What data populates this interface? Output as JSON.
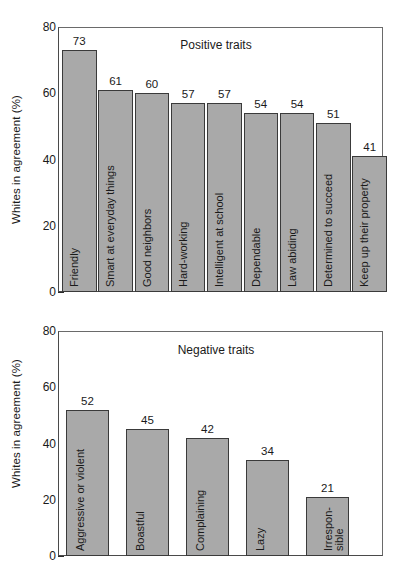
{
  "chart_data": [
    {
      "type": "bar",
      "title": "Positive traits",
      "xlabel": "",
      "ylabel": "Whites in agreement (%)",
      "ylim": [
        0,
        80
      ],
      "yticks": [
        0,
        20,
        40,
        60,
        80
      ],
      "yminorticks": [
        10,
        30,
        50,
        70
      ],
      "grid": false,
      "legend": "none",
      "categories": [
        "Friendly",
        "Smart at everyday things",
        "Good neighbors",
        "Hard-working",
        "Intelligent at school",
        "Dependable",
        "Law abiding",
        "Determined to succeed",
        "Keep up their property"
      ],
      "values": [
        73,
        61,
        60,
        57,
        57,
        54,
        54,
        51,
        41
      ]
    },
    {
      "type": "bar",
      "title": "Negative traits",
      "xlabel": "",
      "ylabel": "Whites in agreement (%)",
      "ylim": [
        0,
        80
      ],
      "yticks": [
        0,
        20,
        40,
        60,
        80
      ],
      "yminorticks": [
        10,
        30,
        50,
        70
      ],
      "grid": false,
      "legend": "none",
      "categories": [
        "Aggressive or violent",
        "Boastful",
        "Complaining",
        "Lazy",
        "Irrespon-\nsible"
      ],
      "values": [
        52,
        45,
        42,
        34,
        21
      ]
    }
  ],
  "style": {
    "bar_fill": "#a9a9a9",
    "bar_stroke": "#3a3a3a",
    "axis_color": "#2b2b2b",
    "text_color": "#1a1a1a",
    "background": "#ffffff"
  }
}
